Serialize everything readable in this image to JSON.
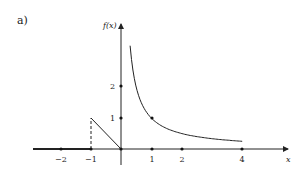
{
  "figure": {
    "part_label": "a)",
    "y_axis_label": "f(x)",
    "x_axis_label": "x"
  },
  "chart_data": {
    "type": "line",
    "title": "",
    "xlabel": "x",
    "ylabel": "f(x)",
    "x_ticks": [
      -2,
      -1,
      1,
      2,
      4
    ],
    "y_ticks": [
      1,
      2
    ],
    "xlim": [
      -3,
      5.3
    ],
    "ylim": [
      0,
      3.2
    ],
    "grid": false,
    "segments": [
      {
        "name": "zero for x < -1",
        "points": [
          [
            -3,
            0
          ],
          [
            -1,
            0
          ]
        ]
      },
      {
        "name": "line from (-1,1) to (0,0)",
        "points": [
          [
            -1,
            1
          ],
          [
            0,
            0
          ]
        ]
      },
      {
        "name": "1/x for x > 0",
        "expr": "1/x",
        "domain": [
          0.3,
          4
        ]
      }
    ],
    "dashed_segments": [
      {
        "points": [
          [
            -1,
            0
          ],
          [
            -1,
            1
          ]
        ]
      }
    ],
    "marked_points": [
      [
        -2,
        0
      ],
      [
        -1,
        0
      ],
      [
        0,
        0
      ],
      [
        1,
        0
      ],
      [
        2,
        0
      ],
      [
        4,
        0
      ],
      [
        0,
        1
      ],
      [
        0,
        2
      ],
      [
        1,
        1
      ]
    ]
  },
  "ticks": {
    "x": [
      "−2",
      "−1",
      "1",
      "2",
      "4"
    ],
    "y": [
      "1",
      "2"
    ]
  }
}
